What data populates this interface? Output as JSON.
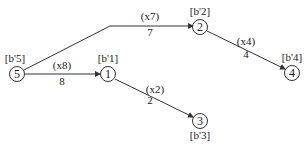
{
  "diagram": {
    "type": "network-flow",
    "nodes": [
      {
        "id": "5",
        "label": "5",
        "supply": "[b'5]",
        "x": 17,
        "y": 74,
        "supply_pos": "above"
      },
      {
        "id": "1",
        "label": "1",
        "supply": "[b'1]",
        "x": 108,
        "y": 74,
        "supply_pos": "above"
      },
      {
        "id": "2",
        "label": "2",
        "supply": "[b'2]",
        "x": 200,
        "y": 27,
        "supply_pos": "above"
      },
      {
        "id": "4",
        "label": "4",
        "supply": "[b'4]",
        "x": 292,
        "y": 73,
        "supply_pos": "above"
      },
      {
        "id": "3",
        "label": "3",
        "supply": "[b'3]",
        "x": 200,
        "y": 121,
        "supply_pos": "below"
      }
    ],
    "edges": [
      {
        "from": "5",
        "to": "2",
        "variable": "(x7)",
        "cost": "7"
      },
      {
        "from": "5",
        "to": "1",
        "variable": "(x8)",
        "cost": "8"
      },
      {
        "from": "1",
        "to": "3",
        "variable": "(x2)",
        "cost": "2"
      },
      {
        "from": "2",
        "to": "4",
        "variable": "(x4)",
        "cost": "4"
      }
    ]
  }
}
